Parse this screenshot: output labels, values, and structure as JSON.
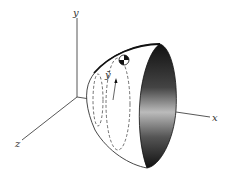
{
  "figure": {
    "axes": {
      "x_label": "x",
      "y_label": "y",
      "z_label": "z"
    },
    "annotations": {
      "centroid_label": "ȳ"
    },
    "colors": {
      "line": "#333333",
      "shade_dark": "#111111",
      "shade_light": "#bbbbbb",
      "background": "#ffffff"
    }
  }
}
